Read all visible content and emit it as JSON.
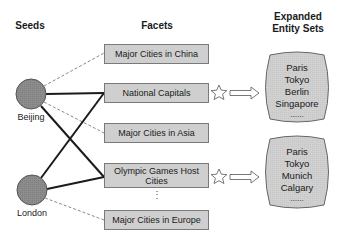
{
  "headers": {
    "seeds": "Seeds",
    "facets": "Facets",
    "expanded_line1": "Expanded",
    "expanded_line2": "Entity Sets"
  },
  "seeds": [
    {
      "label": "Beijing"
    },
    {
      "label": "London"
    }
  ],
  "facets": [
    {
      "label": "Major Cities in China"
    },
    {
      "label": "National Capitals"
    },
    {
      "label": "Major Cities in Asia"
    },
    {
      "label": "Olympic Games Host Cities"
    },
    {
      "label": "Major Cities in Europe"
    }
  ],
  "facet_ellipsis": "⋮",
  "entity_sets": [
    {
      "items": [
        "Paris",
        "Tokyo",
        "Berlin",
        "Singapore"
      ],
      "more": "......"
    },
    {
      "items": [
        "Paris",
        "Tokyo",
        "Munich",
        "Calgary"
      ],
      "more": "......"
    }
  ],
  "colors": {
    "node_fill": "#8c8c8c",
    "box_fill": "#cfcfcf",
    "strong_edge": "#1a1a1a",
    "weak_edge": "#888888"
  }
}
